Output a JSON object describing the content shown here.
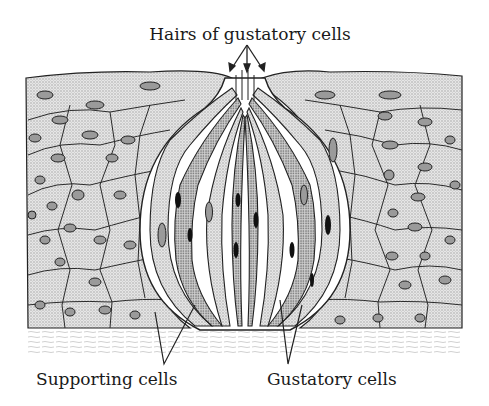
{
  "figure": {
    "labels": {
      "top": "Hairs of gustatory cells",
      "bottom_left": "Supporting cells",
      "bottom_right": "Gustatory cells"
    }
  },
  "colors": {
    "background": "#ffffff",
    "stipple": "#cfcfcf",
    "line": "#222222",
    "nucleus": "#9a9a9a",
    "dark_nucleus": "#111111"
  }
}
